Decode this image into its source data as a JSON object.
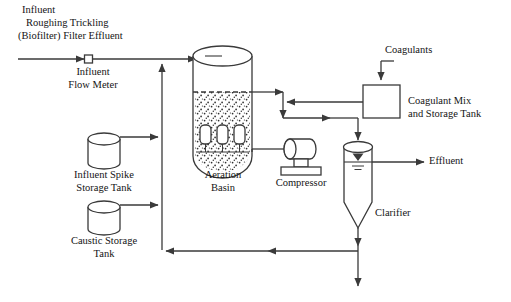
{
  "diagram": {
    "type": "process-flow-diagram",
    "line_color": "#3a3a3a",
    "text_color": "#141414",
    "background": "#ffffff"
  },
  "labels": {
    "influent_source_line1": "Influent",
    "influent_source_line2": "Roughing Trickling",
    "influent_source_line3": "(Biofilter) Filter Effluent",
    "flow_meter_line1": "Influent",
    "flow_meter_line2": "Flow Meter",
    "spike_tank_line1": "Influent Spike",
    "spike_tank_line2": "Storage Tank",
    "caustic_tank_line1": "Caustic Storage",
    "caustic_tank_line2": "Tank",
    "aeration_basin_line1": "Aeration",
    "aeration_basin_line2": "Basin",
    "compressor": "Compressor",
    "coagulants": "Coagulants",
    "coagulant_tank_line1": "Coagulant Mix",
    "coagulant_tank_line2": "and Storage Tank",
    "clarifier": "Clarifier",
    "effluent": "Effluent"
  },
  "equipment": [
    {
      "id": "influent-flow-meter",
      "name": "Influent Flow Meter",
      "shape": "square-inline-meter"
    },
    {
      "id": "influent-spike-storage-tank",
      "name": "Influent Spike Storage Tank",
      "shape": "cylinder"
    },
    {
      "id": "caustic-storage-tank",
      "name": "Caustic Storage Tank",
      "shape": "cylinder"
    },
    {
      "id": "aeration-basin",
      "name": "Aeration Basin",
      "shape": "vessel-with-diffusers",
      "diffusers": 3
    },
    {
      "id": "compressor",
      "name": "Compressor",
      "shape": "horizontal-cylinder-on-base"
    },
    {
      "id": "coagulant-mix-and-storage-tank",
      "name": "Coagulant Mix and Storage Tank",
      "shape": "square-box"
    },
    {
      "id": "clarifier",
      "name": "Clarifier",
      "shape": "cylinder-with-cone-bottom"
    }
  ],
  "streams": [
    {
      "id": "influent-feed",
      "from": "Roughing Trickling (Biofilter) Filter Effluent",
      "to": "Aeration Basin"
    },
    {
      "id": "spike-dose",
      "from": "Influent Spike Storage Tank",
      "to": "influent header"
    },
    {
      "id": "caustic-dose",
      "from": "Caustic Storage Tank",
      "to": "influent header"
    },
    {
      "id": "aeration-to-clarifier",
      "from": "Aeration Basin",
      "to": "Clarifier"
    },
    {
      "id": "coagulant-feed",
      "from": "Coagulants",
      "to": "Coagulant Mix and Storage Tank"
    },
    {
      "id": "coagulant-dose",
      "from": "Coagulant Mix and Storage Tank",
      "to": "mixed liquor line"
    },
    {
      "id": "air-supply",
      "from": "Compressor",
      "to": "Aeration Basin"
    },
    {
      "id": "clarifier-effluent",
      "from": "Clarifier",
      "to": "Effluent"
    },
    {
      "id": "return-sludge",
      "from": "Clarifier underflow",
      "to": "influent header"
    },
    {
      "id": "waste-sludge",
      "from": "Clarifier underflow",
      "to": "waste"
    }
  ]
}
